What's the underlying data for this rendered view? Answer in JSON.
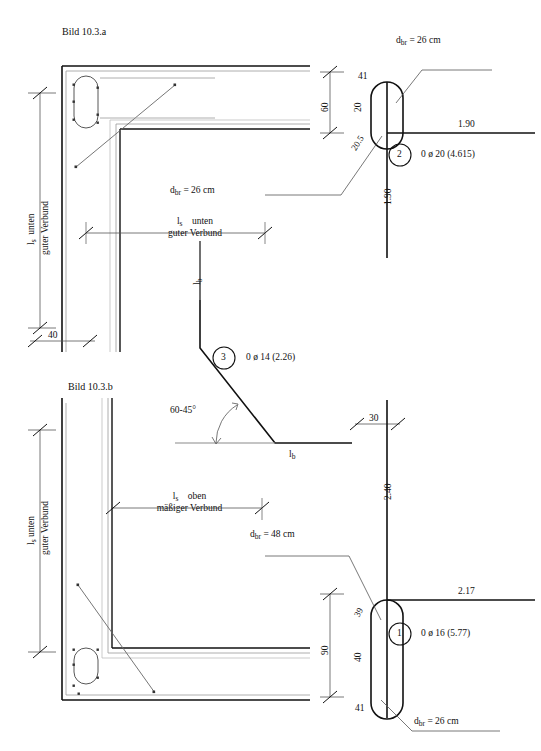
{
  "figure": {
    "title_top": "Bild 10.3.a",
    "title_bottom": "Bild 10.3.b"
  },
  "top_figure": {
    "left_dim": {
      "line1": "l",
      "sub1": "s",
      "line1b": "unten",
      "line2": "guter Verbund"
    },
    "bottom_width_dim": "40",
    "horizontal_dim": {
      "line1": "l",
      "sub1": "s",
      "line1b": "unten",
      "line2": "guter Verbund"
    },
    "lb_label": {
      "main": "l",
      "sub": "b"
    },
    "bend_note_left": {
      "main": "d",
      "sub": "br",
      "rest": "=  26 cm"
    },
    "bend_note_right": {
      "main": "d",
      "sub": "br",
      "rest": "=  26 cm"
    },
    "height_dim": "60",
    "bar_segments": {
      "top_hook": "41",
      "upper": "20",
      "lower": "20.5"
    },
    "bar_lengths": {
      "horizontal": "1.90",
      "vertical": "1.90"
    },
    "mark": {
      "number": "2",
      "text": "0 ø 20 (4.615)"
    }
  },
  "middle_bar": {
    "lb_top": {
      "main": "l",
      "sub": "b"
    },
    "lb_bottom": {
      "main": "l",
      "sub": "b"
    },
    "angle": "60-45°",
    "mark": {
      "number": "3",
      "text": "0 ø 14 (2.26)"
    }
  },
  "bottom_figure": {
    "left_dim": {
      "line1": "l",
      "sub1": "s",
      "line1b": "unten",
      "line2": "guter Verbund"
    },
    "horizontal_dim": {
      "line1": "l",
      "sub1": "s",
      "line1b": "oben",
      "line2": "mäßiger Verbund"
    },
    "bend_note_top": {
      "main": "d",
      "sub": "br",
      "rest": "=  48 cm"
    },
    "bend_note_bottom": {
      "main": "d",
      "sub": "br",
      "rest": "=  26 cm"
    },
    "top_width_dim": "30",
    "height_dim": "90",
    "bar_segments": {
      "upper_hook": "39",
      "middle": "40",
      "bottom_hook": "41"
    },
    "bar_lengths": {
      "vertical": "2.40",
      "horizontal": "2.17"
    },
    "mark": {
      "number": "1",
      "text": "0 ø 16 (5.77)"
    }
  },
  "colors": {
    "ink": "#111111",
    "thin": "#555555",
    "faint": "#8a8a8a",
    "background": "#ffffff"
  }
}
